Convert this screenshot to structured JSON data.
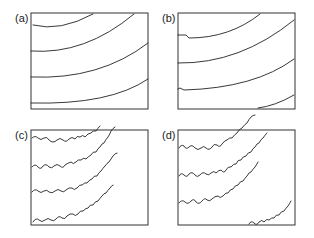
{
  "figure": {
    "panels": [
      {
        "label": "(a)",
        "description": "smooth concentric contour lines"
      },
      {
        "label": "(b)",
        "description": "slightly perturbed contour lines"
      },
      {
        "label": "(c)",
        "description": "wavy contour lines with small loops"
      },
      {
        "label": "(d)",
        "description": "strongly convoluted contour lines with loops"
      }
    ]
  }
}
